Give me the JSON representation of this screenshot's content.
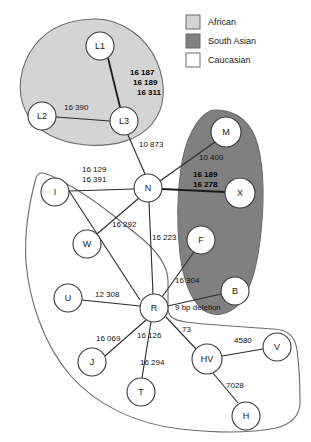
{
  "figure": {
    "type": "phylogenetic-network-diagram",
    "title": "",
    "background": "#ffffff"
  },
  "colors": {
    "african_fill": "#d4d4d4",
    "south_asian_fill": "#808080",
    "caucasian_fill": "#ffffff",
    "outline": "#6b6b6b",
    "edge": "#2b2b2b",
    "text": "#111111"
  },
  "legend": {
    "items": [
      {
        "label": "African",
        "swatch": "#d4d4d4"
      },
      {
        "label": "South Asian",
        "swatch": "#808080"
      },
      {
        "label": "Caucasian",
        "swatch": "#ffffff"
      }
    ]
  },
  "regions": [
    {
      "name": "African",
      "fill": "#d4d4d4"
    },
    {
      "name": "South Asian",
      "fill": "#808080"
    },
    {
      "name": "Caucasian",
      "fill": "#ffffff"
    }
  ],
  "nodes": [
    {
      "id": "L1",
      "label": "L1",
      "x": 100,
      "y": 46,
      "r": 14,
      "region": "African"
    },
    {
      "id": "L2",
      "label": "L2",
      "x": 42,
      "y": 116,
      "r": 14,
      "region": "African"
    },
    {
      "id": "L3",
      "label": "L3",
      "x": 124,
      "y": 121,
      "r": 14,
      "region": "African"
    },
    {
      "id": "N",
      "label": "N",
      "x": 148,
      "y": 188,
      "r": 14,
      "region": "Caucasian"
    },
    {
      "id": "M",
      "label": "M",
      "x": 226,
      "y": 132,
      "r": 15,
      "region": "South Asian"
    },
    {
      "id": "X",
      "label": "X",
      "x": 240,
      "y": 193,
      "r": 15,
      "region": "South Asian"
    },
    {
      "id": "F",
      "label": "F",
      "x": 201,
      "y": 240,
      "r": 14,
      "region": "South Asian"
    },
    {
      "id": "B",
      "label": "B",
      "x": 235,
      "y": 291,
      "r": 14,
      "region": "South Asian"
    },
    {
      "id": "I",
      "label": "I",
      "x": 55,
      "y": 192,
      "r": 14,
      "region": "Caucasian"
    },
    {
      "id": "W",
      "label": "W",
      "x": 87,
      "y": 244,
      "r": 14,
      "region": "Caucasian"
    },
    {
      "id": "U",
      "label": "U",
      "x": 68,
      "y": 298,
      "r": 14,
      "region": "Caucasian"
    },
    {
      "id": "R",
      "label": "R",
      "x": 154,
      "y": 308,
      "r": 14,
      "region": "Caucasian"
    },
    {
      "id": "J",
      "label": "J",
      "x": 92,
      "y": 362,
      "r": 14,
      "region": "Caucasian"
    },
    {
      "id": "T",
      "label": "T",
      "x": 141,
      "y": 392,
      "r": 14,
      "region": "Caucasian"
    },
    {
      "id": "HV",
      "label": "HV",
      "x": 207,
      "y": 359,
      "r": 15,
      "region": "Caucasian"
    },
    {
      "id": "V",
      "label": "V",
      "x": 277,
      "y": 347,
      "r": 14,
      "region": "Caucasian"
    },
    {
      "id": "H",
      "label": "H",
      "x": 246,
      "y": 416,
      "r": 14,
      "region": "Caucasian"
    }
  ],
  "edges": [
    {
      "from": "L1",
      "to": "L3",
      "labels": [
        "16 187",
        "16 189",
        "16 311"
      ],
      "bold": true
    },
    {
      "from": "L2",
      "to": "L3",
      "labels": [
        "16 390"
      ],
      "bold": false
    },
    {
      "from": "L3",
      "to": "N",
      "labels": [
        "10 873"
      ],
      "bold": false
    },
    {
      "from": "N",
      "to": "M",
      "labels": [
        "10 400"
      ],
      "bold": false
    },
    {
      "from": "N",
      "to": "X",
      "labels": [
        "16 189",
        "16 278"
      ],
      "bold": true
    },
    {
      "from": "N",
      "to": "I",
      "labels": [
        "16 129",
        "16 391"
      ],
      "bold": false
    },
    {
      "from": "N",
      "to": "W",
      "labels": [
        "16 292"
      ],
      "bold": false
    },
    {
      "from": "N",
      "to": "R",
      "labels": [
        "16 223"
      ],
      "bold": false
    },
    {
      "from": "R",
      "to": "F",
      "labels": [
        "16 304"
      ],
      "bold": false
    },
    {
      "from": "R",
      "to": "B",
      "labels": [
        "9 bp deletion"
      ],
      "bold": false
    },
    {
      "from": "R",
      "to": "U",
      "labels": [
        "12 308"
      ],
      "bold": false
    },
    {
      "from": "R",
      "to": "J",
      "labels": [
        "16 069",
        "16 126"
      ],
      "bold": false
    },
    {
      "from": "R",
      "to": "T",
      "labels": [
        "16 294"
      ],
      "bold": false
    },
    {
      "from": "R",
      "to": "HV",
      "labels": [
        "73"
      ],
      "bold": false
    },
    {
      "from": "HV",
      "to": "V",
      "labels": [
        "4580"
      ],
      "bold": false
    },
    {
      "from": "HV",
      "to": "H",
      "labels": [
        "7028"
      ],
      "bold": false
    }
  ],
  "edge_labels": [
    {
      "id": "lbl-16187",
      "text": "16 187",
      "x": 130,
      "y": 75,
      "bold": true,
      "anchor": "start"
    },
    {
      "id": "lbl-16189a",
      "text": "16 189",
      "x": 133,
      "y": 85,
      "bold": true,
      "anchor": "start"
    },
    {
      "id": "lbl-16311",
      "text": "16 311",
      "x": 137,
      "y": 95,
      "bold": true,
      "anchor": "start"
    },
    {
      "id": "lbl-16390",
      "text": "16 390",
      "x": 64,
      "y": 110,
      "bold": false,
      "anchor": "start"
    },
    {
      "id": "lbl-10873",
      "text": "10 873",
      "x": 139,
      "y": 147,
      "bold": false,
      "anchor": "start"
    },
    {
      "id": "lbl-10400",
      "text": "10 400",
      "x": 199,
      "y": 160,
      "bold": false,
      "anchor": "start"
    },
    {
      "id": "lbl-16189b",
      "text": "16 189",
      "x": 193,
      "y": 177,
      "bold": true,
      "anchor": "start"
    },
    {
      "id": "lbl-16278",
      "text": "16 278",
      "x": 193,
      "y": 187,
      "bold": true,
      "anchor": "start"
    },
    {
      "id": "lbl-16129",
      "text": "16 129",
      "x": 82,
      "y": 172,
      "bold": false,
      "anchor": "start"
    },
    {
      "id": "lbl-16391",
      "text": "16 391",
      "x": 82,
      "y": 182,
      "bold": false,
      "anchor": "start"
    },
    {
      "id": "lbl-16292",
      "text": "16 292",
      "x": 112,
      "y": 227,
      "bold": false,
      "anchor": "start"
    },
    {
      "id": "lbl-16223",
      "text": "16 223",
      "x": 152,
      "y": 240,
      "bold": false,
      "anchor": "start"
    },
    {
      "id": "lbl-16304",
      "text": "16 304",
      "x": 175,
      "y": 283,
      "bold": false,
      "anchor": "start"
    },
    {
      "id": "lbl-9bp",
      "text": "9 bp deletion",
      "x": 175,
      "y": 310,
      "bold": false,
      "anchor": "start"
    },
    {
      "id": "lbl-12308",
      "text": "12 308",
      "x": 95,
      "y": 297,
      "bold": false,
      "anchor": "start"
    },
    {
      "id": "lbl-73",
      "text": "73",
      "x": 182,
      "y": 332,
      "bold": false,
      "anchor": "start"
    },
    {
      "id": "lbl-16069",
      "text": "16 069",
      "x": 96,
      "y": 341,
      "bold": false,
      "anchor": "start"
    },
    {
      "id": "lbl-16126",
      "text": "16 126",
      "x": 137,
      "y": 338,
      "bold": false,
      "anchor": "start"
    },
    {
      "id": "lbl-16294",
      "text": "16 294",
      "x": 140,
      "y": 365,
      "bold": false,
      "anchor": "start"
    },
    {
      "id": "lbl-4580",
      "text": "4580",
      "x": 234,
      "y": 343,
      "bold": false,
      "anchor": "start"
    },
    {
      "id": "lbl-7028",
      "text": "7028",
      "x": 226,
      "y": 388,
      "bold": false,
      "anchor": "start"
    }
  ]
}
